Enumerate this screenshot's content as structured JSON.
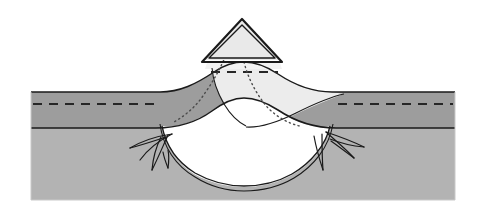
{
  "figure": {
    "title": "Volcanic cone and magma chamber cross-section",
    "caption": "",
    "width": 479,
    "height": 216,
    "background_color": "#ffffff"
  },
  "palette": {
    "upper_stratum_gray": "#9d9d9d",
    "lower_stratum_gray": "#b3b3b3",
    "uplift_light_fill": "#ececec",
    "cone_fill": "#e9e9e9",
    "magma_chamber_fill": "#ffffff",
    "outline_dark": "#1a1a1a",
    "outline_mid": "#3a3a3a",
    "dashed_marker": "#262626",
    "dotted_marker": "#4a4a4a",
    "page_background": "#ffffff"
  },
  "layers": [
    {
      "id": "lower-stratum",
      "label": "Lower stratum (light gray basement rock)",
      "fill": "#b3b3b3",
      "interactable": false
    },
    {
      "id": "upper-stratum",
      "label": "Upper stratum (medium gray sedimentary bed)",
      "fill": "#9d9d9d",
      "interactable": false
    },
    {
      "id": "uplift-wedge",
      "label": "Uplifted light sediment wedge beneath cone",
      "fill": "#ececec",
      "interactable": false
    },
    {
      "id": "magma-chamber",
      "label": "Magma chamber (white lens)",
      "fill": "#ffffff",
      "interactable": false
    },
    {
      "id": "volcanic-cone",
      "label": "Volcanic cone (triangle)",
      "fill": "#e9e9e9",
      "interactable": false
    }
  ],
  "markers": {
    "bedding_dash_left": "dashed horizontal bedding plane, left flank",
    "bedding_dash_right": "dashed horizontal bedding plane, right flank",
    "bedding_dash_crest": "dashed bedding plane across uplifted crest",
    "conduit_dots": "dotted feeder conduit traces from cone to chamber",
    "fracture_left": "fracture fan, left chamber margin",
    "fracture_right": "fracture fan, right chamber margin"
  },
  "annotations": {
    "labels": [],
    "legend": []
  },
  "geometry": {
    "block_left": 31,
    "block_right": 455,
    "block_top": 92,
    "block_bottom": 200,
    "stratum_boundary_y": 128,
    "cone_apex_x": 242,
    "cone_apex_y": 21,
    "cone_base_y": 62,
    "cone_base_left_x": 209,
    "cone_base_right_x": 276,
    "chamber_center_x": 250,
    "chamber_top_y": 106,
    "chamber_bottom_y": 172
  }
}
